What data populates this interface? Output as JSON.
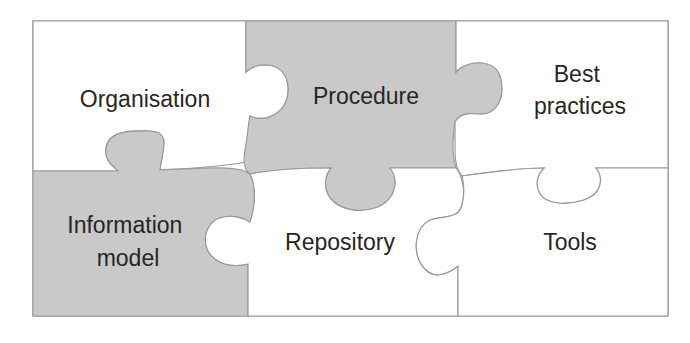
{
  "diagram": {
    "type": "jigsaw-puzzle",
    "colors": {
      "shaded_fill": "#c9c9c9",
      "plain_fill": "#ffffff",
      "outline": "#9a9a9a",
      "text": "#262626"
    },
    "pieces": [
      {
        "id": "organisation",
        "label_lines": [
          "Organisation"
        ],
        "shaded": false,
        "row": 1,
        "col": 1
      },
      {
        "id": "procedure",
        "label_lines": [
          "Procedure"
        ],
        "shaded": true,
        "row": 1,
        "col": 2
      },
      {
        "id": "best-practices",
        "label_lines": [
          "Best",
          "practices"
        ],
        "shaded": false,
        "row": 1,
        "col": 3
      },
      {
        "id": "information-model",
        "label_lines": [
          "Information",
          "model"
        ],
        "shaded": true,
        "row": 2,
        "col": 1
      },
      {
        "id": "repository",
        "label_lines": [
          "Repository"
        ],
        "shaded": false,
        "row": 2,
        "col": 2
      },
      {
        "id": "tools",
        "label_lines": [
          "Tools"
        ],
        "shaded": false,
        "row": 2,
        "col": 3
      }
    ]
  }
}
